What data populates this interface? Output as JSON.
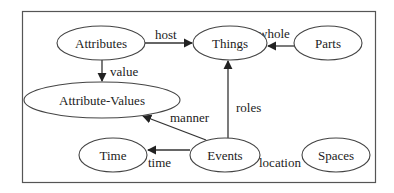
{
  "diagram": {
    "nodes": [
      {
        "id": "attributes",
        "label": "Attributes",
        "cx": 101,
        "cy": 43,
        "rx": 44,
        "ry": 17
      },
      {
        "id": "things",
        "label": "Things",
        "cx": 230,
        "cy": 43,
        "rx": 37,
        "ry": 17
      },
      {
        "id": "parts",
        "label": "Parts",
        "cx": 328,
        "cy": 43,
        "rx": 34,
        "ry": 17
      },
      {
        "id": "attribute-values",
        "label": "Attribute-Values",
        "cx": 102,
        "cy": 100,
        "rx": 78,
        "ry": 18
      },
      {
        "id": "time",
        "label": "Time",
        "cx": 113,
        "cy": 155,
        "rx": 34,
        "ry": 17
      },
      {
        "id": "events",
        "label": "Events",
        "cx": 225,
        "cy": 155,
        "rx": 35,
        "ry": 17
      },
      {
        "id": "spaces",
        "label": "Spaces",
        "cx": 336,
        "cy": 155,
        "rx": 34,
        "ry": 17
      }
    ],
    "edges": [
      {
        "from": "attributes",
        "to": "things",
        "label": "host"
      },
      {
        "from": "parts",
        "to": "things",
        "label": "whole"
      },
      {
        "from": "attributes",
        "to": "attribute-values",
        "label": "value"
      },
      {
        "from": "events",
        "to": "things",
        "label": "roles"
      },
      {
        "from": "events",
        "to": "attribute-values",
        "label": "manner"
      },
      {
        "from": "events",
        "to": "time",
        "label": "time"
      },
      {
        "from": "events",
        "to": "spaces",
        "label": "location"
      }
    ]
  }
}
